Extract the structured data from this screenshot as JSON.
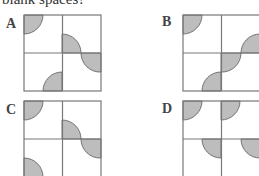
{
  "question": {
    "text": "blank spaces?"
  },
  "options": [
    {
      "label": "A",
      "id": "option-a"
    },
    {
      "label": "B",
      "id": "option-b"
    },
    {
      "label": "C",
      "id": "option-c"
    },
    {
      "label": "D",
      "id": "option-d"
    }
  ],
  "colors": {
    "shape_fill": "#bdbdbd",
    "grid_line": "#777777"
  }
}
